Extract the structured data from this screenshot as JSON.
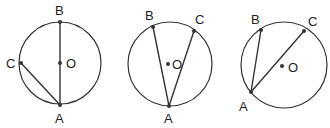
{
  "diagram": {
    "stroke_color": "#333333",
    "figures": [
      {
        "id": "figure-1",
        "circle": {
          "cx": 60,
          "cy": 63,
          "r": 41
        },
        "points": {
          "A": {
            "x": 60,
            "y": 105,
            "label": "A",
            "lx": 55,
            "ly": 123
          },
          "B": {
            "x": 60,
            "y": 22,
            "label": "B",
            "lx": 55,
            "ly": 15
          },
          "C": {
            "x": 21,
            "y": 63,
            "label": "C",
            "lx": 6,
            "ly": 68
          },
          "O": {
            "x": 60,
            "y": 63,
            "label": "O",
            "lx": 66,
            "ly": 68
          }
        },
        "segments": [
          [
            "B",
            "A"
          ],
          [
            "C",
            "A"
          ]
        ]
      },
      {
        "id": "figure-2",
        "circle": {
          "cx": 170,
          "cy": 64,
          "r": 42
        },
        "points": {
          "A": {
            "x": 169,
            "y": 106,
            "label": "A",
            "lx": 164,
            "ly": 123
          },
          "B": {
            "x": 153,
            "y": 27,
            "label": "B",
            "lx": 145,
            "ly": 20
          },
          "C": {
            "x": 194,
            "y": 31,
            "label": "C",
            "lx": 195,
            "ly": 24
          },
          "O": {
            "x": 168,
            "y": 64,
            "label": "O",
            "lx": 172,
            "ly": 69
          }
        },
        "segments": [
          [
            "B",
            "A"
          ],
          [
            "C",
            "A"
          ]
        ]
      },
      {
        "id": "figure-3",
        "circle": {
          "cx": 284,
          "cy": 65,
          "r": 43
        },
        "points": {
          "A": {
            "x": 251,
            "y": 92,
            "label": "A",
            "lx": 239,
            "ly": 111
          },
          "B": {
            "x": 261,
            "y": 30,
            "label": "B",
            "lx": 251,
            "ly": 24
          },
          "C": {
            "x": 304,
            "y": 31,
            "label": "C",
            "lx": 308,
            "ly": 26
          },
          "O": {
            "x": 282,
            "y": 66,
            "label": "O",
            "lx": 288,
            "ly": 72
          }
        },
        "segments": [
          [
            "B",
            "A"
          ],
          [
            "C",
            "A"
          ]
        ]
      }
    ]
  }
}
